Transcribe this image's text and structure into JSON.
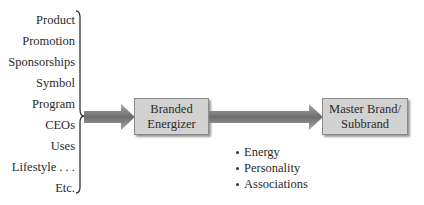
{
  "diagram": {
    "sources": [
      "Product",
      "Promotion",
      "Sponsorships",
      "Symbol",
      "Program",
      "CEOs",
      "Uses",
      "Lifestyle . . .",
      "Etc."
    ],
    "boxes": {
      "energizer": [
        "Branded",
        "Energizer"
      ],
      "master": [
        "Master Brand/",
        "Subbrand"
      ]
    },
    "benefits": [
      "Energy",
      "Personality",
      "Associations"
    ],
    "colors": {
      "box_fill": "#d2d2d2",
      "box_border": "#8a8a8a",
      "arrow_dark": "#6e6e6e",
      "arrow_light": "#a8a8a8",
      "text": "#2a2a2a"
    }
  }
}
